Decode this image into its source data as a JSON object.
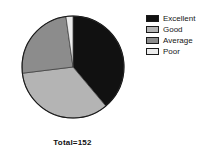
{
  "chart_data": {
    "type": "pie",
    "title": "",
    "subtitle": "",
    "xlabel": "",
    "ylabel": "",
    "total_label": "Total=152",
    "total": 152,
    "legend_position": "right",
    "grid": false,
    "categories": [
      "Excellent",
      "Good",
      "Average",
      "Poor"
    ],
    "values": [
      59,
      52,
      36,
      5
    ],
    "percentages": [
      38.8,
      34.2,
      23.7,
      3.3
    ],
    "start_angle_deg": [
      0,
      140,
      263,
      352
    ],
    "end_angle_deg": [
      140,
      263,
      352,
      360
    ],
    "colors": [
      "#111111",
      "#b4b4b4",
      "#8c8c8c",
      "#ececec"
    ],
    "slices": [
      {
        "label": "Excellent",
        "value": 59,
        "percent": 38.8,
        "color": "#111111"
      },
      {
        "label": "Good",
        "value": 52,
        "percent": 34.2,
        "color": "#b4b4b4"
      },
      {
        "label": "Average",
        "value": 36,
        "percent": 23.7,
        "color": "#8c8c8c"
      },
      {
        "label": "Poor",
        "value": 5,
        "percent": 3.3,
        "color": "#ececec"
      }
    ]
  },
  "legend": {
    "items": [
      {
        "label": "Excellent",
        "color": "#111111"
      },
      {
        "label": "Good",
        "color": "#b4b4b4"
      },
      {
        "label": "Average",
        "color": "#8c8c8c"
      },
      {
        "label": "Poor",
        "color": "#ececec"
      }
    ]
  },
  "footer": {
    "total_text": "Total=152"
  },
  "style": {
    "background": "#ffffff",
    "outline": "#1a1a1a",
    "text": "#161616"
  }
}
